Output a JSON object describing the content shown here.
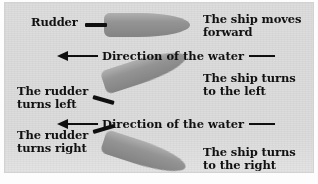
{
  "figure": {
    "background_color": "#dcdcdc",
    "hull_color": "#8d8d8d",
    "ink_color": "#111111"
  },
  "labels": {
    "rudder": "Rudder",
    "ship_moves_forward": "The ship moves\nforward",
    "rudder_turns_left": "The rudder\nturns left",
    "ship_turns_left": "The ship turns\nto the left",
    "rudder_turns_right": "The rudder\nturns right",
    "ship_turns_right": "The ship turns\nto the right"
  },
  "water_rows": [
    {
      "text": "Direction of the water",
      "arrow_direction": "left"
    },
    {
      "text": "Direction of the water",
      "arrow_direction": "left"
    }
  ],
  "panels": [
    {
      "name": "forward",
      "rudder_state": "centered",
      "ship_state": "moves forward",
      "ship_rotation_deg": 0
    },
    {
      "name": "turn-left",
      "rudder_state": "turns left",
      "ship_state": "turns to the left",
      "ship_rotation_deg": -18
    },
    {
      "name": "turn-right",
      "rudder_state": "turns right",
      "ship_state": "turns to the right",
      "ship_rotation_deg": 18
    }
  ]
}
